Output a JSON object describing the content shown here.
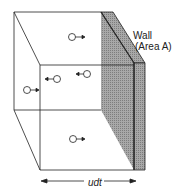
{
  "diagram": {
    "type": "3d-box-with-wall",
    "labels": {
      "wall": "Wall",
      "area": "(Area A)",
      "distance": "udt"
    },
    "colors": {
      "stroke": "#222222",
      "wall_fill": "#9a9a9a",
      "background": "#ffffff"
    },
    "particles": [
      {
        "x": 72,
        "y": 37,
        "dir": "right"
      },
      {
        "x": 57,
        "y": 79,
        "dir": "left"
      },
      {
        "x": 87,
        "y": 74,
        "dir": "left"
      },
      {
        "x": 27,
        "y": 90,
        "dir": "right"
      },
      {
        "x": 73,
        "y": 139,
        "dir": "right"
      }
    ]
  }
}
